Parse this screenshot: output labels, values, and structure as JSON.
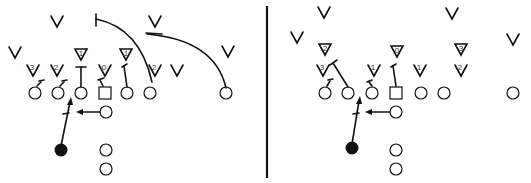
{
  "diagram": {
    "type": "football-play-diagram",
    "colors": {
      "ink": "#111111",
      "background": "#ffffff"
    },
    "divider": {
      "x": 267,
      "y1": 6,
      "y2": 178
    },
    "panels": [
      {
        "id": "left",
        "defenders_v": [
          {
            "x": 57,
            "y": 22,
            "label": ""
          },
          {
            "x": 155,
            "y": 22,
            "label": ""
          },
          {
            "x": 15,
            "y": 53,
            "label": ""
          },
          {
            "x": 228,
            "y": 52,
            "label": ""
          },
          {
            "x": 33,
            "y": 71,
            "label": "3"
          },
          {
            "x": 57,
            "y": 71,
            "label": "2"
          },
          {
            "x": 105,
            "y": 71,
            "label": "0"
          },
          {
            "x": 155,
            "y": 71,
            "label": "2"
          },
          {
            "x": 177,
            "y": 71,
            "label": ""
          }
        ],
        "defenders_tri": [
          {
            "x": 81,
            "y": 55,
            "label": "1"
          },
          {
            "x": 126,
            "y": 55,
            "label": "1"
          }
        ],
        "offense_circles": [
          {
            "x": 35,
            "y": 93
          },
          {
            "x": 58,
            "y": 93
          },
          {
            "x": 81,
            "y": 93
          },
          {
            "x": 127,
            "y": 93
          },
          {
            "x": 150,
            "y": 93
          },
          {
            "x": 226,
            "y": 93
          },
          {
            "x": 106,
            "y": 112
          },
          {
            "x": 106,
            "y": 150
          },
          {
            "x": 106,
            "y": 169
          }
        ],
        "center": {
          "x": 105,
          "y": 93
        },
        "ball_carrier": {
          "x": 61,
          "y": 150
        }
      },
      {
        "id": "right",
        "defenders_v": [
          {
            "x": 324,
            "y": 13,
            "label": ""
          },
          {
            "x": 452,
            "y": 14,
            "label": ""
          },
          {
            "x": 297,
            "y": 38,
            "label": ""
          },
          {
            "x": 513,
            "y": 40,
            "label": ""
          },
          {
            "x": 323,
            "y": 71,
            "label": "3"
          },
          {
            "x": 374,
            "y": 71,
            "label": "1"
          },
          {
            "x": 420,
            "y": 71,
            "label": "1"
          },
          {
            "x": 461,
            "y": 71,
            "label": "2"
          }
        ],
        "defenders_tri": [
          {
            "x": 325,
            "y": 50,
            "label": "2"
          },
          {
            "x": 397,
            "y": 52,
            "label": "0"
          },
          {
            "x": 461,
            "y": 50,
            "label": "3"
          }
        ],
        "offense_circles": [
          {
            "x": 325,
            "y": 93
          },
          {
            "x": 348,
            "y": 93
          },
          {
            "x": 372,
            "y": 93
          },
          {
            "x": 421,
            "y": 93
          },
          {
            "x": 444,
            "y": 93
          },
          {
            "x": 513,
            "y": 93
          },
          {
            "x": 396,
            "y": 112
          },
          {
            "x": 396,
            "y": 150
          },
          {
            "x": 396,
            "y": 169
          }
        ],
        "center": {
          "x": 396,
          "y": 93
        },
        "ball_carrier": {
          "x": 352,
          "y": 148
        }
      }
    ]
  }
}
